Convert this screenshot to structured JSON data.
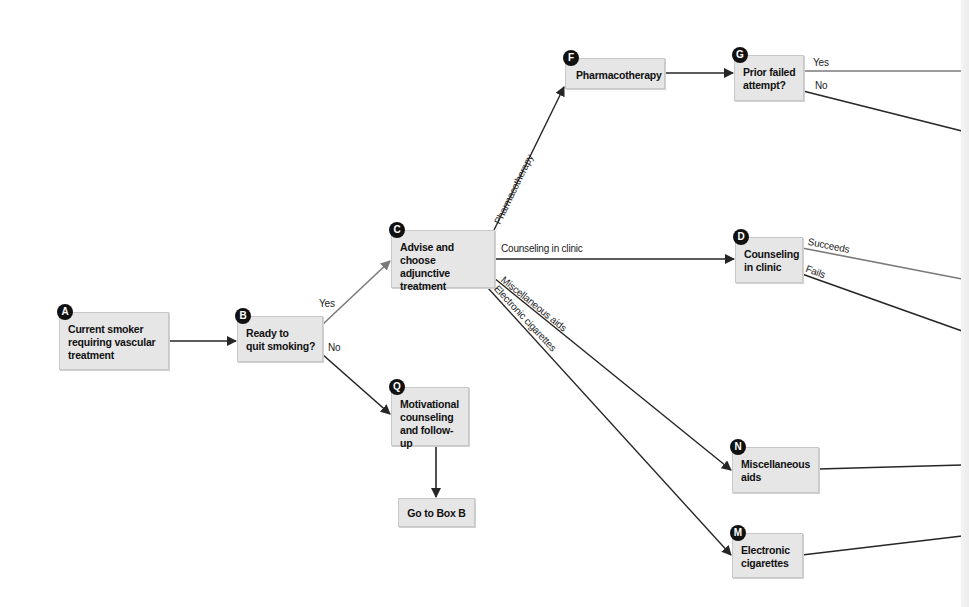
{
  "diagram": {
    "type": "flowchart",
    "colors": {
      "box_fill": "#e6e6e6",
      "box_border": "#c8c8c8",
      "badge": "#111111",
      "edge_dark": "#262626",
      "edge_gray": "#7a7a7a"
    },
    "nodes": {
      "A": {
        "badge": "A",
        "text": "Current smoker\nrequiring vascular\ntreatment"
      },
      "B": {
        "badge": "B",
        "text": "Ready to\nquit smoking?"
      },
      "C": {
        "badge": "C",
        "text": "Advise and\nchoose adjunctive\ntreatment"
      },
      "F": {
        "badge": "F",
        "text": "Pharmacotherapy"
      },
      "G": {
        "badge": "G",
        "text": "Prior failed\nattempt?"
      },
      "D": {
        "badge": "D",
        "text": "Counseling\nin clinic"
      },
      "Q": {
        "badge": "Q",
        "text": "Motivational\ncounseling\nand follow-up"
      },
      "GoB": {
        "text": "Go to Box B"
      },
      "N": {
        "badge": "N",
        "text": "Miscellaneous\naids"
      },
      "M": {
        "badge": "M",
        "text": "Electronic\ncigarettes"
      }
    },
    "edge_labels": {
      "b_yes": "Yes",
      "b_no": "No",
      "c_pharma": "Pharmacotherapy",
      "c_counsel": "Counseling in clinic",
      "c_misc": "Miscellaneous aids",
      "c_ecig": "Electronic cigarettes",
      "g_yes": "Yes",
      "g_no": "No",
      "d_succeeds": "Succeeds",
      "d_fails": "Fails"
    },
    "edges": [
      {
        "from": "A",
        "to": "B"
      },
      {
        "from": "B",
        "to": "C",
        "label": "Yes"
      },
      {
        "from": "B",
        "to": "Q",
        "label": "No"
      },
      {
        "from": "C",
        "to": "F",
        "label": "Pharmacotherapy"
      },
      {
        "from": "C",
        "to": "D",
        "label": "Counseling in clinic"
      },
      {
        "from": "C",
        "to": "N",
        "label": "Miscellaneous aids"
      },
      {
        "from": "C",
        "to": "M",
        "label": "Electronic cigarettes"
      },
      {
        "from": "F",
        "to": "G"
      },
      {
        "from": "Q",
        "to": "GoB"
      },
      {
        "from": "G",
        "to": "offscreen",
        "label": "Yes"
      },
      {
        "from": "G",
        "to": "offscreen",
        "label": "No"
      },
      {
        "from": "D",
        "to": "offscreen",
        "label": "Succeeds"
      },
      {
        "from": "D",
        "to": "offscreen",
        "label": "Fails"
      },
      {
        "from": "N",
        "to": "offscreen"
      },
      {
        "from": "M",
        "to": "offscreen"
      }
    ]
  }
}
